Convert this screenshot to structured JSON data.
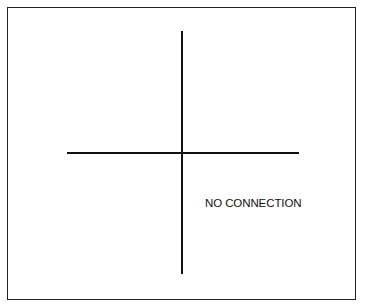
{
  "diagram": {
    "type": "schematic-symbol",
    "symbol": "crossing-wires-no-connection",
    "label": "NO CONNECTION",
    "wires": {
      "horizontal": {
        "x1": 67,
        "y1": 153,
        "x2": 299,
        "y2": 153
      },
      "vertical": {
        "x1": 182,
        "y1": 31,
        "x2": 182,
        "y2": 274
      }
    },
    "colors": {
      "line": "#111111",
      "border": "#222222",
      "background": "#ffffff"
    }
  }
}
